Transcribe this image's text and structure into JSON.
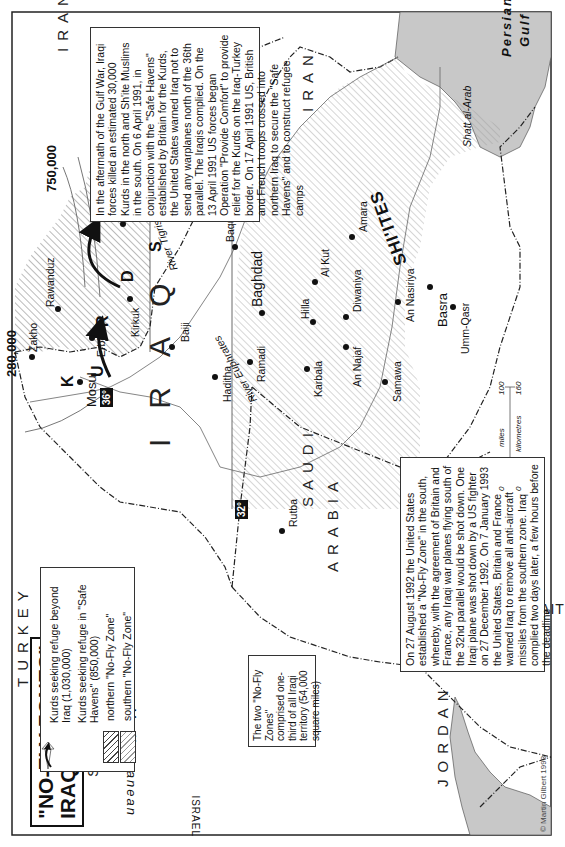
{
  "title": {
    "line1": "\"NO-FLY ZONES\"",
    "line2": "IRAQ, 1991-1993"
  },
  "countries": {
    "iran_north": "IRAN",
    "iran_south": "IRAN",
    "turkey": "TURKEY",
    "syria": "SYRIA",
    "iraq": "IRAQ",
    "saudi_arabia_1": "SAUDI",
    "saudi_arabia_2": "ARABIA",
    "jordan": "JORDAN",
    "kuwait": "KUWAIT",
    "lebanon": "LEBANON",
    "israel": "ISRAEL"
  },
  "seas": {
    "mediterranean": "Mediterranean",
    "persian_gulf_1": "Persian",
    "persian_gulf_2": "Gulf"
  },
  "regions": {
    "kurds": [
      "K",
      "U",
      "R",
      "D",
      "S"
    ],
    "shiites": "SHI'ITES"
  },
  "cities": [
    {
      "name": "Zakho"
    },
    {
      "name": "Mosul"
    },
    {
      "name": "Erbil"
    },
    {
      "name": "Rawanduz"
    },
    {
      "name": "Kirkuk"
    },
    {
      "name": "Sulaimaniya"
    },
    {
      "name": "Baiji"
    },
    {
      "name": "Khaniqin"
    },
    {
      "name": "Baquba"
    },
    {
      "name": "Baghdad"
    },
    {
      "name": "Haditha"
    },
    {
      "name": "Ramadi"
    },
    {
      "name": "Rutba"
    },
    {
      "name": "Karbala"
    },
    {
      "name": "Hilla"
    },
    {
      "name": "Al Kut"
    },
    {
      "name": "Diwaniya"
    },
    {
      "name": "An Najaf"
    },
    {
      "name": "Samawa"
    },
    {
      "name": "An Nasiriya"
    },
    {
      "name": "Amara"
    },
    {
      "name": "Basra"
    },
    {
      "name": "Umm-Qasr"
    }
  ],
  "rivers": {
    "tigris": "River Tigris",
    "euphrates": "River Euphrates",
    "shatt": "Shatt al-Arab"
  },
  "refugee_counts": {
    "turkey": "280,000",
    "iran": "750,000"
  },
  "parallels": {
    "north": "36°",
    "south": "32°"
  },
  "legend": {
    "items": [
      {
        "symbol": "open-arrow",
        "label": "Kurds seeking refuge beyond Iraq (1,030,000)"
      },
      {
        "symbol": "black-arrow",
        "label": "Kurds seeking refuge in \"Safe Havens\" (850,000)"
      },
      {
        "symbol": "hatch-dark",
        "label": "northern \"No-Fly Zone\""
      },
      {
        "symbol": "hatch-light",
        "label": "southern \"No-Fly Zone\""
      }
    ]
  },
  "notes": {
    "north": "In the aftermath of the Gulf War, Iraqi forces killed an estimated 30,000 Kurds in the north and Sh'ite Muslims in the south. On 6 April 1991, in conjunction with the \"Safe Havens\" established by Britain for the Kurds, the United States warned Iraq not to send any warplanes north of the 36th parallel. The Iraqis complied. On the 13 April 1991 US forces began Operation \"Provide Comfort\" to provide relief for the Kurds on the Iraq-Turkey border. On 17 April 1991 US, British and French troops crossed into northern Iraq to secure the \"Safe Havens\" and to construct refugee camps",
    "south": "On 27 August 1992 the United States established a \"No-Fly Zone\" in the south, whereby, with the agreement of Britain and France, any Iraqi war planes flying south of the 32nd parallel would be shot down. One Iraqi plane was shot down by a US fighter on 27 December 1992. On 7 January 1993 the United States, Britain and France warned Iraq to remove all anti-aircraft missiles from the southern zone. Iraq complied two days later, a few hours before the deadline",
    "territory": "The two \"No-Fly Zones\" comprised one-third of all Iraqi territory (54,000 square miles)"
  },
  "scale": {
    "miles_label": "miles",
    "km_label": "kilometres",
    "miles_min": "0",
    "miles_max": "100",
    "km_min": "0",
    "km_max": "160"
  },
  "credit": "© Martin Gilbert 1993",
  "colors": {
    "water": "#c8c8c8",
    "border": "#222222",
    "hatch_north": "#444444",
    "hatch_south": "#999999"
  }
}
